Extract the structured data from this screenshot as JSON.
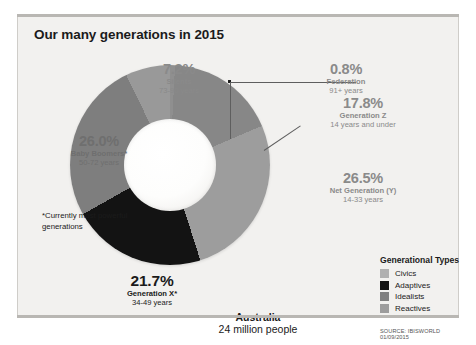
{
  "card": {
    "title": "Our many generations in 2015",
    "footnote": "*Currently most powerful generations",
    "country_name": "Australia",
    "country_population": "24 million people",
    "source": "SOURCE: IBISWORLD 01/09/2015"
  },
  "legend": {
    "title": "Generational Types",
    "items": [
      {
        "label": "Civics",
        "color": "#b0b0b0"
      },
      {
        "label": "Adaptives",
        "color": "#131313"
      },
      {
        "label": "Idealists",
        "color": "#808080"
      },
      {
        "label": "Reactives",
        "color": "#9d9d9d"
      }
    ]
  },
  "labels": {
    "silents": {
      "pct": "7.2%",
      "name": "Silents",
      "age": "73-90 years"
    },
    "federation": {
      "pct": "0.8%",
      "name": "Federation",
      "age": "91+ years"
    },
    "genz": {
      "pct": "17.8%",
      "name": "Generation Z",
      "age": "14 years and under"
    },
    "nety": {
      "pct": "26.5%",
      "name": "Net Generation (Y)",
      "age": "14-33 years"
    },
    "boomers": {
      "pct": "26.0%",
      "name": "Baby Boomers*",
      "age": "50-72 years"
    },
    "genx": {
      "pct": "21.7%",
      "name": "Generation X*",
      "age": "34-49 years"
    }
  },
  "chart_data": {
    "type": "pie",
    "title": "Our many generations in 2015",
    "subtitle": "Australia — 24 million people",
    "donut": true,
    "inner_radius_ratio": 0.46,
    "start_angle_deg": 0,
    "direction": "clockwise",
    "units": "percent",
    "total": 100.0,
    "categories": [
      "Federation",
      "Generation Z",
      "Net Generation (Y)",
      "Generation X",
      "Baby Boomers",
      "Silents"
    ],
    "values": [
      0.8,
      17.8,
      26.5,
      21.7,
      26.0,
      7.2
    ],
    "slices": [
      {
        "label": "Federation",
        "value": 0.8,
        "age_range": "91+ years",
        "generational_type": "Civics",
        "color": "#8f8f8f"
      },
      {
        "label": "Generation Z",
        "value": 17.8,
        "age_range": "14 years and under",
        "generational_type": "Idealists",
        "color": "#878787"
      },
      {
        "label": "Net Generation (Y)",
        "value": 26.5,
        "age_range": "14-33 years",
        "generational_type": "Reactives",
        "color": "#9d9d9d"
      },
      {
        "label": "Generation X",
        "value": 21.7,
        "age_range": "34-49 years",
        "generational_type": "Adaptives",
        "color": "#131313"
      },
      {
        "label": "Baby Boomers",
        "value": 26.0,
        "age_range": "50-72 years",
        "generational_type": "Idealists",
        "color": "#7e7e7e"
      },
      {
        "label": "Silents",
        "value": 7.2,
        "age_range": "73-90 years",
        "generational_type": "Reactives",
        "color": "#999999"
      }
    ],
    "legend": {
      "title": "Generational Types",
      "position": "bottom-right",
      "entries": [
        "Civics",
        "Adaptives",
        "Idealists",
        "Reactives"
      ]
    },
    "annotations": [
      "*Currently most powerful generations",
      "Australia 24 million people",
      "SOURCE: IBISWORLD 01/09/2015"
    ],
    "grid": false
  }
}
